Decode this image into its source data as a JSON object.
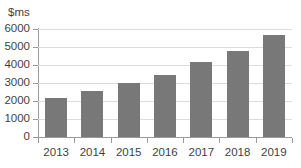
{
  "chart_data": {
    "type": "bar",
    "title": "",
    "subtitle": "",
    "xlabel": "",
    "ylabel": "$ms",
    "categories": [
      "2013",
      "2014",
      "2015",
      "2016",
      "2017",
      "2018",
      "2019"
    ],
    "values": [
      2180,
      2550,
      3000,
      3470,
      4150,
      4780,
      5650
    ],
    "series": [
      {
        "name": "",
        "values": [
          2180,
          2550,
          3000,
          3470,
          4150,
          4780,
          5650
        ]
      }
    ],
    "ylim": [
      0,
      6000
    ],
    "yticks": [
      0,
      1000,
      2000,
      3000,
      4000,
      5000,
      6000
    ],
    "ytick_labels": [
      "0",
      "1000",
      "2000",
      "3000",
      "4000",
      "5000",
      "6000"
    ],
    "grid": true,
    "grid_axis": "y",
    "legend": false,
    "legend_position": "none",
    "bar_color": "#787878",
    "grid_color": "#dcdcdc",
    "axis_color": "#9a9a9a",
    "text_color": "#3f3f3f",
    "background": "#ffffff",
    "annotations": []
  }
}
